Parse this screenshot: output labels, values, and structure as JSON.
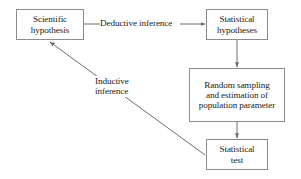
{
  "diagram": {
    "background_color": "#ffffff",
    "stroke_color": "#8c8c8c",
    "line_color": "#6e6e6e",
    "text_color": "#1a1a1a",
    "nodes": [
      {
        "id": "scientific-hypothesis",
        "label": "Scientific\nhypothesis",
        "x": 16,
        "y": 9,
        "w": 68,
        "h": 31
      },
      {
        "id": "statistical-hypotheses",
        "label": "Statistical\nhypotheses",
        "x": 206,
        "y": 9,
        "w": 62,
        "h": 31
      },
      {
        "id": "random-sampling",
        "label": "Random sampling\nand estimation of\npopulation parameter",
        "x": 189,
        "y": 68,
        "w": 96,
        "h": 54
      },
      {
        "id": "statistical-test",
        "label": "Statistical\ntest",
        "x": 206,
        "y": 139,
        "w": 62,
        "h": 31
      }
    ],
    "edges": [
      {
        "id": "deductive",
        "from": "scientific-hypothesis",
        "to": "statistical-hypotheses",
        "label": "Deductive inference",
        "arrowhead": "end"
      },
      {
        "id": "hypotheses-to-sampling",
        "from": "statistical-hypotheses",
        "to": "random-sampling",
        "label": "",
        "arrowhead": "end"
      },
      {
        "id": "sampling-to-test",
        "from": "random-sampling",
        "to": "statistical-test",
        "label": "",
        "arrowhead": "end"
      },
      {
        "id": "inductive",
        "from": "statistical-test",
        "to": "scientific-hypothesis",
        "label": "Inductive\ninference",
        "arrowhead": "end"
      }
    ]
  }
}
